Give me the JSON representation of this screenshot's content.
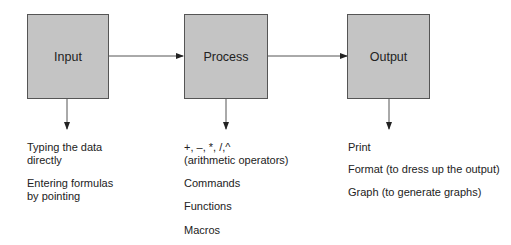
{
  "diagram": {
    "nodes": [
      {
        "id": "input",
        "label": "Input"
      },
      {
        "id": "process",
        "label": "Process"
      },
      {
        "id": "output",
        "label": "Output"
      }
    ],
    "edges": [
      {
        "from": "input",
        "to": "process"
      },
      {
        "from": "process",
        "to": "output"
      }
    ],
    "details": {
      "input": [
        "Typing the data",
        "directly",
        "Entering formulas",
        "by  pointing"
      ],
      "process": [
        "+, –, *, /,^",
        "(arithmetic operators)",
        "Commands",
        "Functions",
        "Macros"
      ],
      "output": [
        "Print",
        "Format (to dress up the output)",
        "Graph (to generate graphs)"
      ]
    },
    "colors": {
      "box_fill": "#c4c4c4",
      "box_border": "#555555",
      "line": "#333333"
    }
  }
}
